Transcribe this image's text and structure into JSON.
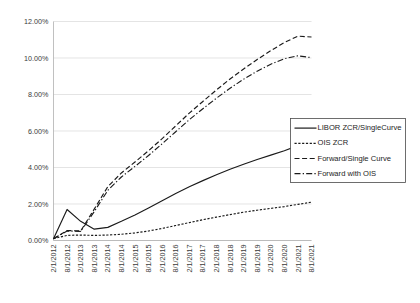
{
  "chart_data": {
    "type": "line",
    "title": "",
    "xlabel": "",
    "ylabel": "",
    "ylim": [
      0,
      12
    ],
    "ytick_labels": [
      "0.00%",
      "2.00%",
      "4.00%",
      "6.00%",
      "8.00%",
      "10.00%",
      "12.00%"
    ],
    "ytick_values": [
      0,
      2,
      4,
      6,
      8,
      10,
      12
    ],
    "grid": true,
    "grid_axis": "y",
    "legend_position": "right",
    "categories": [
      "2/1/2012",
      "8/1/2012",
      "2/1/2013",
      "8/1/2013",
      "2/1/2014",
      "8/1/2014",
      "2/1/2015",
      "8/1/2015",
      "2/1/2016",
      "8/1/2016",
      "2/1/2017",
      "8/1/2017",
      "2/1/2018",
      "8/1/2018",
      "2/1/2019",
      "8/1/2019",
      "2/1/2020",
      "8/1/2020",
      "2/1/2021",
      "8/1/2021"
    ],
    "series": [
      {
        "name": "LIBOR ZCR/SingleCurve",
        "style": "solid",
        "values": [
          0.1,
          1.7,
          1.05,
          0.62,
          0.72,
          1.05,
          1.4,
          1.78,
          2.18,
          2.58,
          2.95,
          3.28,
          3.6,
          3.9,
          4.18,
          4.44,
          4.68,
          4.92,
          5.2,
          5.52
        ]
      },
      {
        "name": "OIS ZCR",
        "style": "dotted",
        "values": [
          0.1,
          0.28,
          0.3,
          0.28,
          0.3,
          0.34,
          0.42,
          0.52,
          0.66,
          0.82,
          0.98,
          1.14,
          1.28,
          1.42,
          1.55,
          1.66,
          1.76,
          1.86,
          1.98,
          2.1
        ]
      },
      {
        "name": "Forward/Single Curve",
        "style": "dashed",
        "values": [
          0.1,
          0.55,
          0.52,
          1.72,
          2.95,
          3.7,
          4.3,
          4.92,
          5.58,
          6.28,
          6.98,
          7.62,
          8.25,
          8.85,
          9.4,
          9.92,
          10.4,
          10.85,
          11.2,
          11.15
        ]
      },
      {
        "name": "Forward with OIS",
        "style": "dashdot",
        "values": [
          0.1,
          0.52,
          0.5,
          1.58,
          2.75,
          3.48,
          4.06,
          4.66,
          5.3,
          5.96,
          6.62,
          7.22,
          7.8,
          8.34,
          8.84,
          9.28,
          9.66,
          9.96,
          10.12,
          10.02
        ]
      }
    ]
  },
  "legend": {
    "entries": [
      {
        "label": "LIBOR ZCR/SingleCurve"
      },
      {
        "label": "OIS ZCR"
      },
      {
        "label": "Forward/Single Curve"
      },
      {
        "label": "Forward with OIS"
      }
    ]
  },
  "colors": {
    "line": "#1a1a1a",
    "grid": "#d9d9d9",
    "axis": "#b0b0b0",
    "text": "#3a3a3a",
    "background": "#ffffff"
  }
}
